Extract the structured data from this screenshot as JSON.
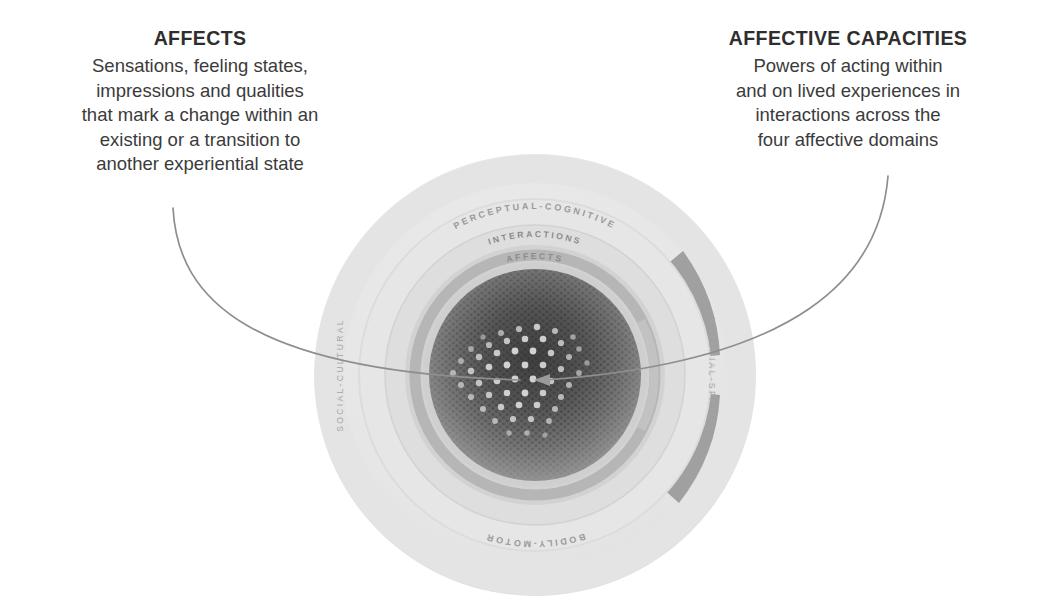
{
  "callouts": {
    "affects": {
      "title": "AFFECTS",
      "lines": [
        "Sensations, feeling states,",
        "impressions and qualities",
        "that mark a change within an",
        "existing or a transition to",
        "another experiential state"
      ]
    },
    "capacities": {
      "title": "AFFECTIVE CAPACITIES",
      "lines": [
        "Powers of acting within",
        "and on lived experiences in",
        "interactions across the",
        "four affective domains"
      ]
    }
  },
  "diagram": {
    "domains": {
      "top": "PERCEPTUAL-COGNITIVE",
      "right": "MATERIAL-SPATIAL",
      "bottom": "BODILY-MOTOR",
      "left": "SOCIAL-CULTURAL"
    },
    "rings": {
      "interactions": "INTERACTIONS",
      "affects": "AFFECTS"
    },
    "colors": {
      "outer_ring_light": "#e9e9e9",
      "outer_ring_dark": "#9a9a9a",
      "mid_ring": "#d6d6d6",
      "inner_ring": "#bdbdbd",
      "core_dark": "#4a4a4a",
      "core_mid": "#7b7b7b",
      "dot_highlight": "#d8d8d8",
      "connector_line": "#8e8e8e",
      "background": "#ffffff"
    }
  }
}
